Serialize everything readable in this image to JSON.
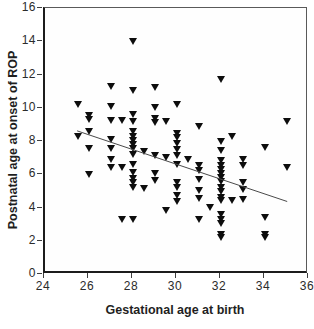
{
  "figure": {
    "background": "#ffffff",
    "frame_color": "#5a5a5a",
    "axis_color": "#1c1c1c",
    "tick_color": "#3f3f3f",
    "tick_label_color": "#2b2b2b",
    "title_color": "#1f1f1f"
  },
  "chart_data": {
    "type": "scatter",
    "title": "",
    "xlabel": "Gestational age at birth",
    "ylabel": "Postnatal age at onset of ROP",
    "xlim": [
      24,
      36
    ],
    "ylim": [
      0,
      16
    ],
    "xticks": [
      24,
      26,
      28,
      30,
      32,
      34,
      36
    ],
    "yticks": [
      0,
      2,
      4,
      6,
      8,
      10,
      12,
      14,
      16
    ],
    "grid": false,
    "legend": null,
    "marker": "filled-downward-triangle",
    "marker_color": "#0d0d0d",
    "points": [
      [
        25.5,
        10.2
      ],
      [
        25.5,
        8.3
      ],
      [
        26,
        9.55
      ],
      [
        26,
        9.3
      ],
      [
        26,
        8.6
      ],
      [
        26,
        7.55
      ],
      [
        26,
        6.0
      ],
      [
        27,
        11.25
      ],
      [
        27,
        10.05
      ],
      [
        27,
        9.25
      ],
      [
        27,
        8.1
      ],
      [
        27,
        7.55
      ],
      [
        27,
        6.9
      ],
      [
        27,
        6.4
      ],
      [
        27.5,
        9.25
      ],
      [
        27.5,
        6.4
      ],
      [
        27.5,
        3.3
      ],
      [
        28,
        14.0
      ],
      [
        28,
        11.05
      ],
      [
        28,
        9.6
      ],
      [
        28,
        9.2
      ],
      [
        28,
        8.6
      ],
      [
        28,
        8.3
      ],
      [
        28,
        8.05
      ],
      [
        28,
        7.8
      ],
      [
        28,
        7.55
      ],
      [
        28,
        7.2
      ],
      [
        28,
        6.6
      ],
      [
        28,
        6.1
      ],
      [
        28,
        5.75
      ],
      [
        28,
        5.5
      ],
      [
        28,
        5.2
      ],
      [
        28,
        3.3
      ],
      [
        28.5,
        7.35
      ],
      [
        28.5,
        5.15
      ],
      [
        29,
        11.2
      ],
      [
        29,
        10.0
      ],
      [
        29,
        9.35
      ],
      [
        29,
        9.1
      ],
      [
        29,
        7.1
      ],
      [
        29,
        6.05
      ],
      [
        29,
        5.65
      ],
      [
        29.5,
        9.15
      ],
      [
        29.5,
        7.0
      ],
      [
        29.5,
        3.8
      ],
      [
        30,
        10.2
      ],
      [
        30,
        8.45
      ],
      [
        30,
        8.2
      ],
      [
        30,
        7.85
      ],
      [
        30,
        7.5
      ],
      [
        30,
        7.1
      ],
      [
        30,
        6.6
      ],
      [
        30,
        5.5
      ],
      [
        30,
        5.2
      ],
      [
        30,
        4.75
      ],
      [
        30,
        4.35
      ],
      [
        30.5,
        6.9
      ],
      [
        31,
        8.9
      ],
      [
        31,
        6.55
      ],
      [
        31,
        6.2
      ],
      [
        31,
        5.7
      ],
      [
        31,
        5.05
      ],
      [
        31,
        4.55
      ],
      [
        31,
        3.3
      ],
      [
        31.5,
        4.0
      ],
      [
        32,
        11.7
      ],
      [
        32,
        8.0
      ],
      [
        32,
        7.45
      ],
      [
        32,
        6.8
      ],
      [
        32,
        6.55
      ],
      [
        32,
        6.3
      ],
      [
        32,
        6.05
      ],
      [
        32,
        5.8
      ],
      [
        32,
        5.55
      ],
      [
        32,
        5.2
      ],
      [
        32,
        4.95
      ],
      [
        32,
        4.6
      ],
      [
        32,
        4.4
      ],
      [
        32,
        3.6
      ],
      [
        32,
        3.3
      ],
      [
        32,
        3.05
      ],
      [
        32,
        2.4
      ],
      [
        32,
        2.2
      ],
      [
        32.5,
        8.3
      ],
      [
        32.5,
        4.4
      ],
      [
        33,
        6.9
      ],
      [
        33,
        6.5
      ],
      [
        33,
        5.5
      ],
      [
        33,
        5.1
      ],
      [
        33,
        4.5
      ],
      [
        34,
        7.6
      ],
      [
        34,
        3.4
      ],
      [
        34,
        2.35
      ],
      [
        34,
        2.2
      ],
      [
        35,
        9.2
      ],
      [
        35,
        6.4
      ]
    ],
    "trend_line": {
      "x_start": 25.55,
      "y_start": 8.55,
      "x_end": 35.1,
      "y_end": 4.3,
      "color": "#4a4a4a"
    }
  }
}
